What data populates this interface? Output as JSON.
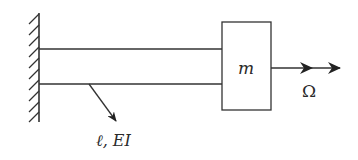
{
  "diagram": {
    "wall": {
      "type": "fixed-support"
    },
    "beam": {
      "label": "ℓ, EI"
    },
    "mass": {
      "label": "m"
    },
    "rotation": {
      "label": "Ω"
    }
  },
  "colors": {
    "stroke": "#333333",
    "background": "#ffffff"
  }
}
